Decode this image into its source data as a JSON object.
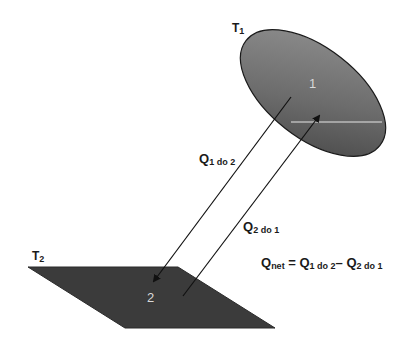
{
  "diagram": {
    "surface1": {
      "temperature_label": "T",
      "temperature_sub": "1",
      "id_label": "1",
      "shape": "ellipse",
      "fill_light": "#8a8a8a",
      "fill_dark": "#4a4a4a"
    },
    "surface2": {
      "temperature_label": "T",
      "temperature_sub": "2",
      "id_label": "2",
      "shape": "parallelogram",
      "fill": "#3a3a3a"
    },
    "arrows": [
      {
        "label": "Q",
        "sub": "1 do 2",
        "direction": "surface 1 to surface 2"
      },
      {
        "label": "Q",
        "sub": "2 do 1",
        "direction": "surface 2 to surface 1"
      }
    ],
    "equation": {
      "lhs": "Q",
      "lhs_sub": "net",
      "equals": " = ",
      "term1": "Q",
      "term1_sub": "1 do 2",
      "minus": "– ",
      "term2": "Q",
      "term2_sub": "2 do 1"
    }
  }
}
